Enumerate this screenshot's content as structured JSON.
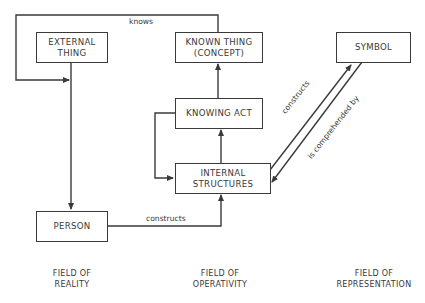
{
  "diagram": {
    "boxes": {
      "external_thing": [
        "EXTERNAL",
        "THING"
      ],
      "known_thing": [
        "KNOWN THING",
        "(CONCEPT)"
      ],
      "symbol": [
        "SYMBOL"
      ],
      "knowing_act": [
        "KNOWING ACT"
      ],
      "internal_structures": [
        "INTERNAL",
        "STRUCTURES"
      ],
      "person": [
        "PERSON"
      ]
    },
    "edges": {
      "knows": "knows",
      "person_constructs": "constructs",
      "symbol_constructs": "constructs",
      "is_comprehended_by": "is comprehended by"
    },
    "fields": {
      "reality": [
        "FIELD OF",
        "REALITY"
      ],
      "operativity": [
        "FIELD OF",
        "OPERATIVITY"
      ],
      "representation": [
        "FIELD OF",
        "REPRESENTATION"
      ]
    },
    "colors": {
      "line": "#3a3a3a",
      "background": "#ffffff"
    }
  }
}
